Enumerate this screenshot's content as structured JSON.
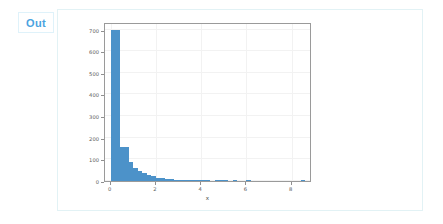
{
  "cell": {
    "prompt_label": "Out"
  },
  "chart_data": {
    "type": "bar",
    "subtype": "histogram",
    "title": "",
    "xlabel": "x",
    "ylabel": "",
    "xlim": [
      -0.25,
      8.9
    ],
    "ylim": [
      0,
      735
    ],
    "grid": true,
    "legend": null,
    "bar_color": "#4c92c9",
    "bin_width": 0.2,
    "xticks": [
      0,
      2,
      4,
      6,
      8
    ],
    "xtick_labels": [
      "0",
      "2",
      "4",
      "6",
      "8"
    ],
    "yticks": [
      0,
      100,
      200,
      300,
      400,
      500,
      600,
      700
    ],
    "ytick_labels": [
      "0",
      "100",
      "200",
      "300",
      "400",
      "500",
      "600",
      "700"
    ],
    "bins": [
      {
        "x0": 0.0,
        "x1": 0.2,
        "count": 700
      },
      {
        "x0": 0.2,
        "x1": 0.4,
        "count": 697
      },
      {
        "x0": 0.4,
        "x1": 0.6,
        "count": 158
      },
      {
        "x0": 0.6,
        "x1": 0.8,
        "count": 155
      },
      {
        "x0": 0.8,
        "x1": 1.0,
        "count": 86
      },
      {
        "x0": 1.0,
        "x1": 1.2,
        "count": 62
      },
      {
        "x0": 1.2,
        "x1": 1.4,
        "count": 48
      },
      {
        "x0": 1.4,
        "x1": 1.6,
        "count": 36
      },
      {
        "x0": 1.6,
        "x1": 1.8,
        "count": 30
      },
      {
        "x0": 1.8,
        "x1": 2.0,
        "count": 22
      },
      {
        "x0": 2.0,
        "x1": 2.2,
        "count": 16
      },
      {
        "x0": 2.2,
        "x1": 2.4,
        "count": 13
      },
      {
        "x0": 2.4,
        "x1": 2.6,
        "count": 11
      },
      {
        "x0": 2.6,
        "x1": 2.8,
        "count": 8
      },
      {
        "x0": 2.8,
        "x1": 3.0,
        "count": 7
      },
      {
        "x0": 3.0,
        "x1": 3.2,
        "count": 6
      },
      {
        "x0": 3.2,
        "x1": 3.4,
        "count": 5
      },
      {
        "x0": 3.4,
        "x1": 3.6,
        "count": 4
      },
      {
        "x0": 3.6,
        "x1": 3.8,
        "count": 3
      },
      {
        "x0": 3.8,
        "x1": 4.0,
        "count": 3
      },
      {
        "x0": 4.0,
        "x1": 4.2,
        "count": 2
      },
      {
        "x0": 4.2,
        "x1": 4.4,
        "count": 2
      },
      {
        "x0": 4.6,
        "x1": 4.8,
        "count": 2
      },
      {
        "x0": 4.8,
        "x1": 5.0,
        "count": 3
      },
      {
        "x0": 5.0,
        "x1": 5.2,
        "count": 2
      },
      {
        "x0": 5.4,
        "x1": 5.6,
        "count": 1
      },
      {
        "x0": 6.0,
        "x1": 6.2,
        "count": 1
      },
      {
        "x0": 8.4,
        "x1": 8.6,
        "count": 1
      }
    ]
  }
}
